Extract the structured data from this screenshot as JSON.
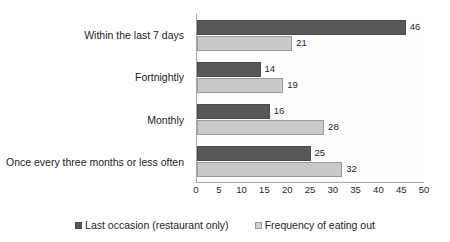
{
  "chart_data": {
    "type": "bar",
    "orientation": "horizontal",
    "title": "",
    "xlabel": "",
    "ylabel": "",
    "xlim": [
      0,
      50
    ],
    "xticks": [
      0,
      5,
      10,
      15,
      20,
      25,
      30,
      35,
      40,
      45,
      50
    ],
    "grid": false,
    "legend_position": "bottom-center",
    "categories": [
      "Within the last 7 days",
      "Fortnightly",
      "Monthly",
      "Once every three months or less often"
    ],
    "series": [
      {
        "name": "Last occasion (restaurant only)",
        "color": "#585858",
        "values": [
          46,
          14,
          16,
          25
        ]
      },
      {
        "name": "Frequency of eating out",
        "color": "#c9c9c9",
        "values": [
          21,
          19,
          28,
          32
        ]
      }
    ]
  }
}
